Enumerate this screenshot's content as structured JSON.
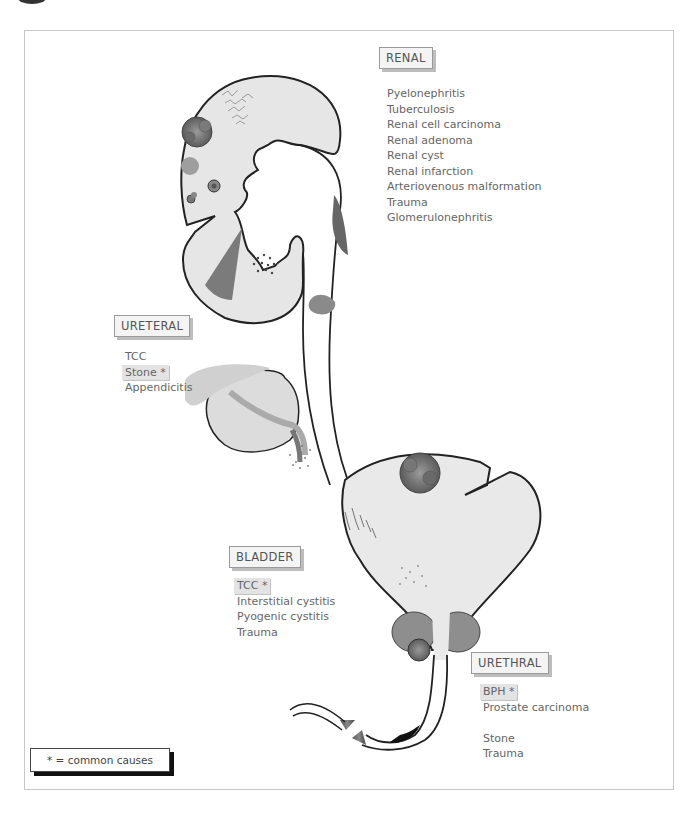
{
  "sections": {
    "renal": {
      "title": "RENAL",
      "items": [
        "Pyelonephritis",
        "Tuberculosis",
        "Renal cell carcinoma",
        "Renal adenoma",
        "Renal cyst",
        "Renal infarction",
        "Arteriovenous malformation",
        "Trauma",
        "Glomerulonephritis"
      ]
    },
    "ureteral": {
      "title": "URETERAL",
      "items": [
        "TCC",
        "Stone *",
        "Appendicitis"
      ]
    },
    "bladder": {
      "title": "BLADDER",
      "items": [
        "TCC *",
        "Interstitial cystitis",
        "Pyogenic cystitis",
        "Trauma"
      ]
    },
    "urethral": {
      "title": "URETHRAL",
      "items": [
        "BPH *",
        "Prostate carcinoma",
        "",
        "Stone",
        "Trauma"
      ]
    }
  },
  "legend": {
    "text": "* = common causes"
  },
  "colors": {
    "organ_fill": "#e6e6e6",
    "lesion_dark": "#6f6f6f",
    "lesion_mid": "#9a9a9a",
    "outline": "#222222"
  }
}
